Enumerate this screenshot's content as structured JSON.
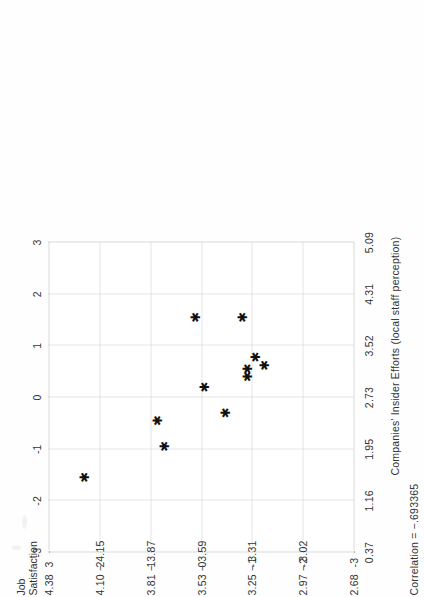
{
  "figure": {
    "y_axis_title_line1": "Job",
    "y_axis_title_line2": "Satisfaction",
    "x_axis_title": "Companies' Insider Efforts (local staff perception)",
    "correlation_label": "Correlation = −.693365"
  },
  "chart_data": {
    "type": "scatter",
    "title": "",
    "xlabel": "Companies' Insider Efforts (local staff perception)",
    "ylabel": "Job Satisfaction",
    "grid": true,
    "legend": "none",
    "xlim": [
      -3,
      3
    ],
    "ylim": [
      -3,
      3
    ],
    "x_tick_labels_standardized": [
      "-3",
      "-2",
      "-1",
      "0",
      "1",
      "2",
      "3"
    ],
    "y_tick_labels_standardized": [
      "3",
      "2",
      "1",
      "0",
      "-1",
      "-2",
      "-3"
    ],
    "x_tick_labels_raw": [
      "0.37",
      "1.16",
      "1.95",
      "2.73",
      "3.52",
      "4.31",
      "5.09"
    ],
    "y_tick_labels_raw": [
      "4.38",
      "4.10 − 4.15",
      "3.81 − 3.87",
      "3.53 − 3.59",
      "3.25 − 3.31",
      "2.97 − 3.02",
      "2.68"
    ],
    "correlation": -0.693365,
    "points": [
      {
        "x": -1.55,
        "y": 2.15
      },
      {
        "x": -0.45,
        "y": 0.72
      },
      {
        "x": -0.95,
        "y": 0.58
      },
      {
        "x": 0.2,
        "y": -0.2
      },
      {
        "x": -0.3,
        "y": -0.62
      },
      {
        "x": 0.55,
        "y": -1.05
      },
      {
        "x": 0.4,
        "y": -1.05
      },
      {
        "x": 0.78,
        "y": -1.2
      },
      {
        "x": 0.62,
        "y": -1.38
      },
      {
        "x": 1.55,
        "y": -0.02
      },
      {
        "x": 1.55,
        "y": -0.95
      }
    ]
  },
  "axis_geometry": {
    "x_tick_px": [
      0,
      51.7,
      103.3,
      155,
      206.7,
      258.3,
      310
    ],
    "y_tick_px": [
      0,
      50.8,
      101.7,
      152.5,
      203.3,
      254.2,
      305
    ]
  }
}
